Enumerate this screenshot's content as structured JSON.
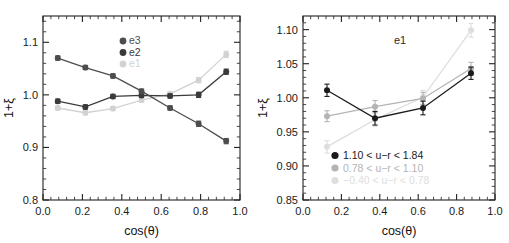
{
  "figure": {
    "background_color": "#ffffff",
    "width": 509,
    "height": 243,
    "panels": [
      "left",
      "right"
    ]
  },
  "chart_data": [
    {
      "panel": "left",
      "type": "line",
      "title": "",
      "xlabel": "cos(θ)",
      "ylabel": "1+ξ",
      "xlim": [
        0.0,
        1.0
      ],
      "ylim": [
        0.8,
        1.15
      ],
      "xticks": [
        0.0,
        0.2,
        0.4,
        0.6,
        0.8,
        1.0
      ],
      "xticklabels": [
        "0.0",
        "0.2",
        "0.4",
        "0.6",
        "0.8",
        "1.0"
      ],
      "yticks": [
        0.8,
        0.9,
        1.0,
        1.1
      ],
      "yticklabels": [
        "0.8",
        "0.9",
        "1.0",
        "1.1"
      ],
      "grid": false,
      "minor_ticks": true,
      "ticks_all_sides": true,
      "legend_position": "upper-center",
      "x": [
        0.075,
        0.215,
        0.355,
        0.5,
        0.645,
        0.79,
        0.93
      ],
      "series": [
        {
          "name": "e3",
          "label": "e3",
          "color": "#4d4d4d",
          "values": [
            1.07,
            1.052,
            1.036,
            1.007,
            0.975,
            0.945,
            0.912
          ],
          "errors": [
            0.004,
            0.004,
            0.004,
            0.004,
            0.004,
            0.005,
            0.005
          ]
        },
        {
          "name": "e2",
          "label": "e2",
          "color": "#3a3a3a",
          "values": [
            0.988,
            0.977,
            0.997,
            0.999,
            0.998,
            1.0,
            1.044
          ],
          "errors": [
            0.004,
            0.004,
            0.004,
            0.004,
            0.004,
            0.005,
            0.005
          ]
        },
        {
          "name": "e1",
          "label": "e1",
          "color": "#d2d2d2",
          "values": [
            0.975,
            0.966,
            0.974,
            0.99,
            1.002,
            1.028,
            1.077
          ],
          "errors": [
            0.004,
            0.004,
            0.004,
            0.004,
            0.004,
            0.005,
            0.006
          ]
        }
      ]
    },
    {
      "panel": "right",
      "type": "line",
      "title": "",
      "annotation": "e1",
      "xlabel": "cos(θ)",
      "ylabel": "1+ξ",
      "xlim": [
        0.0,
        1.0
      ],
      "ylim": [
        0.85,
        1.12
      ],
      "xticks": [
        0.0,
        0.2,
        0.4,
        0.6,
        0.8,
        1.0
      ],
      "xticklabels": [
        "0.0",
        "0.2",
        "0.4",
        "0.6",
        "0.8",
        "1.0"
      ],
      "yticks": [
        0.85,
        0.9,
        0.95,
        1.0,
        1.05,
        1.1
      ],
      "yticklabels": [
        "0.85",
        "0.90",
        "0.95",
        "1.00",
        "1.05",
        "1.10"
      ],
      "grid": false,
      "minor_ticks": true,
      "ticks_all_sides": true,
      "legend_position": "lower-center",
      "x": [
        0.125,
        0.375,
        0.625,
        0.875
      ],
      "series": [
        {
          "name": "red-bin",
          "label": "1.10  < u−r < 1.84",
          "color": "#1a1a1a",
          "values": [
            1.011,
            0.97,
            0.985,
            1.036
          ],
          "errors": [
            0.009,
            0.01,
            0.01,
            0.009
          ]
        },
        {
          "name": "mid-bin",
          "label": "0.78  < u−r < 1.10",
          "color": "#b4b4b4",
          "values": [
            0.973,
            0.987,
            0.999,
            1.043
          ],
          "errors": [
            0.008,
            0.009,
            0.009,
            0.009
          ]
        },
        {
          "name": "blue-bin",
          "label": "−0.40  < u−r < 0.78",
          "color": "#dedede",
          "values": [
            0.928,
            0.968,
            1.001,
            1.099
          ],
          "errors": [
            0.009,
            0.01,
            0.01,
            0.01
          ]
        }
      ]
    }
  ]
}
